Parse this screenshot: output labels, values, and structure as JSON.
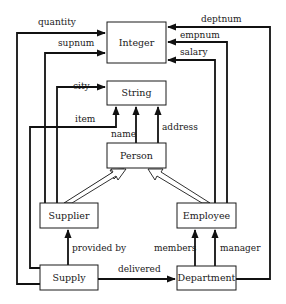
{
  "diagram": {
    "type": "entity-relationship / type graph",
    "nodes": {
      "integer": {
        "label": "Integer"
      },
      "string": {
        "label": "String"
      },
      "person": {
        "label": "Person"
      },
      "supplier": {
        "label": "Supplier"
      },
      "employee": {
        "label": "Employee"
      },
      "supply": {
        "label": "Supply"
      },
      "department": {
        "label": "Department"
      }
    },
    "edges": {
      "quantity": {
        "label": "quantity",
        "from": "Supply",
        "to": "Integer"
      },
      "supnum": {
        "label": "supnum",
        "from": "Supplier",
        "to": "Integer"
      },
      "city": {
        "label": "city",
        "from": "Supplier",
        "to": "String"
      },
      "item": {
        "label": "item",
        "from": "Supply",
        "to": "String"
      },
      "name": {
        "label": "name",
        "from": "Person",
        "to": "String"
      },
      "address": {
        "label": "address",
        "from": "Person",
        "to": "String"
      },
      "deptnum": {
        "label": "deptnum",
        "from": "Department",
        "to": "Integer"
      },
      "empnum": {
        "label": "empnum",
        "from": "Employee",
        "to": "Integer"
      },
      "salary": {
        "label": "salary",
        "from": "Employee",
        "to": "Integer"
      },
      "provided_by": {
        "label": "provided by",
        "from": "Supply",
        "to": "Supplier"
      },
      "delivered": {
        "label": "delivered",
        "from": "Supply",
        "to": "Department"
      },
      "members": {
        "label": "members",
        "from": "Department",
        "to": "Employee"
      },
      "manager": {
        "label": "manager",
        "from": "Department",
        "to": "Employee"
      }
    },
    "isa": [
      {
        "from": "Supplier",
        "to": "Person"
      },
      {
        "from": "Employee",
        "to": "Person"
      }
    ]
  }
}
